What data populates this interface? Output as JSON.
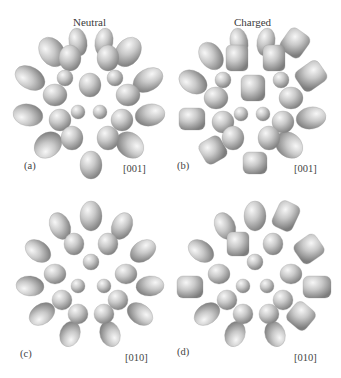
{
  "figure": {
    "column_titles": [
      "Neutral",
      "Charged"
    ],
    "panels": [
      {
        "label": "(a)",
        "direction": "[001]",
        "state": "Neutral"
      },
      {
        "label": "(b)",
        "direction": "[001]",
        "state": "Charged"
      },
      {
        "label": "(c)",
        "direction": "[010]",
        "state": "Neutral"
      },
      {
        "label": "(d)",
        "direction": "[010]",
        "state": "Charged"
      }
    ],
    "colors": {
      "lobe_light": "#f2f2f2",
      "lobe_mid": "#bdbdbd",
      "lobe_dark": "#7a7a7a",
      "background": "#ffffff"
    }
  }
}
